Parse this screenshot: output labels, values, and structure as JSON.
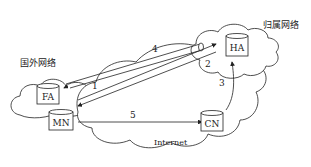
{
  "networks": {
    "foreign": "国外网络",
    "home": "归属网络",
    "internet": "Internet"
  },
  "nodes": {
    "fa": "FA",
    "mn": "MN",
    "ha": "HA",
    "cn": "CN"
  },
  "links": {
    "l1": "1",
    "l2": "2",
    "l3": "3",
    "l4": "4",
    "l5": "5"
  },
  "colors": {
    "stroke": "#222222",
    "background": "#ffffff"
  }
}
